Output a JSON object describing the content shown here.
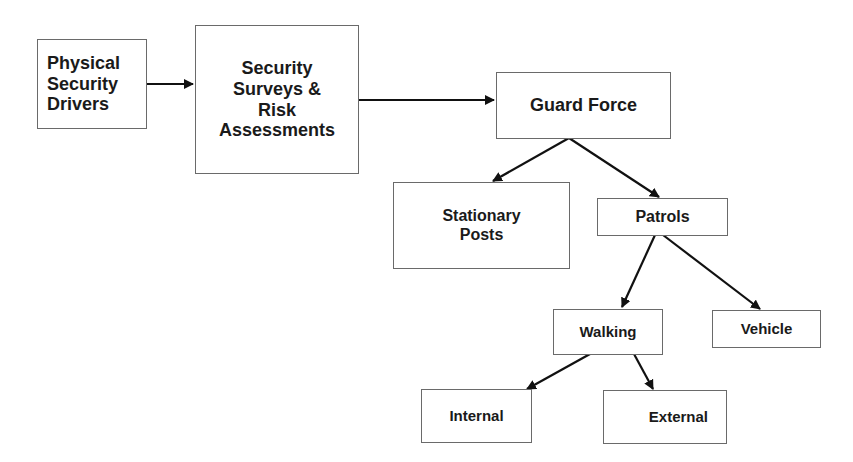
{
  "diagram": {
    "title": "",
    "nodes": {
      "drivers": {
        "label": "Physical\nSecurity\nDrivers"
      },
      "surveys": {
        "label": "Security\nSurveys &\nRisk\nAssessments"
      },
      "guard_force": {
        "label": "Guard Force"
      },
      "stationary_posts": {
        "label": "Stationary\nPosts"
      },
      "patrols": {
        "label": "Patrols"
      },
      "walking": {
        "label": "Walking"
      },
      "vehicle": {
        "label": "Vehicle"
      },
      "internal": {
        "label": "Internal"
      },
      "external": {
        "label": "External"
      }
    },
    "edges": [
      {
        "from": "drivers",
        "to": "surveys"
      },
      {
        "from": "surveys",
        "to": "guard_force"
      },
      {
        "from": "guard_force",
        "to": "stationary_posts"
      },
      {
        "from": "guard_force",
        "to": "patrols"
      },
      {
        "from": "patrols",
        "to": "walking"
      },
      {
        "from": "patrols",
        "to": "vehicle"
      },
      {
        "from": "walking",
        "to": "internal"
      },
      {
        "from": "walking",
        "to": "external"
      }
    ],
    "colors": {
      "box_border": "#6a6a6a",
      "arrow": "#111111",
      "text": "#1a1a1a",
      "background": "#ffffff"
    }
  }
}
